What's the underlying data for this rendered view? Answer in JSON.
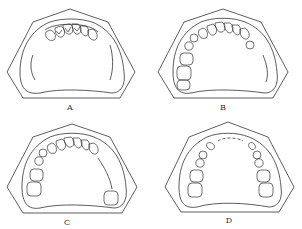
{
  "figure": {
    "line_color": "#333333",
    "background": "#ffffff",
    "panels": [
      {
        "id": "A",
        "label": "A",
        "teeth_present": "anterior incisors and canines only (6 front teeth)",
        "edentulous": "both posterior regions"
      },
      {
        "id": "B",
        "label": "B",
        "teeth_present": "anterior teeth, right premolars and molars, left premolars",
        "edentulous": "left posterior (molars)"
      },
      {
        "id": "C",
        "label": "C",
        "teeth_present": "anterior teeth, right premolars and molars, isolated left last molar",
        "edentulous": "left premolar/molar span bounded by teeth"
      },
      {
        "id": "D",
        "label": "D",
        "teeth_present": "bilateral premolars and molars",
        "edentulous": "anterior region (incisors and canines)"
      }
    ]
  }
}
